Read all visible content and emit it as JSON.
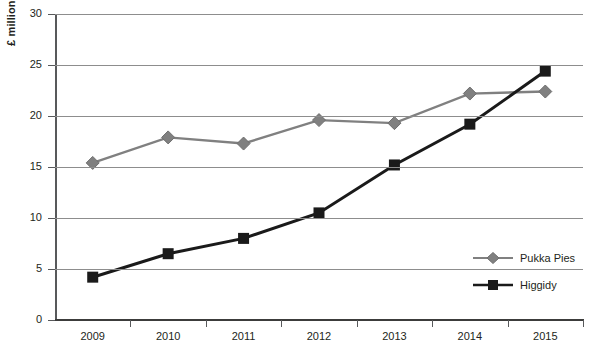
{
  "chart_data": {
    "type": "line",
    "title": "",
    "xlabel": "",
    "ylabel": "£ millions",
    "categories": [
      "2009",
      "2010",
      "2011",
      "2012",
      "2013",
      "2014",
      "2015"
    ],
    "ylim": [
      0,
      30
    ],
    "ytick_step": 5,
    "yticks": [
      "0",
      "5",
      "10",
      "15",
      "20",
      "25",
      "30"
    ],
    "grid": true,
    "legend_position": "right-inside",
    "series": [
      {
        "name": "Pukka Pies",
        "color": "#808080",
        "marker": "diamond",
        "values": [
          15.4,
          17.9,
          17.3,
          19.6,
          19.3,
          22.2,
          22.4
        ]
      },
      {
        "name": "Higgidy",
        "color": "#1a1a1a",
        "marker": "square",
        "values": [
          4.2,
          6.5,
          8.0,
          10.5,
          15.2,
          19.2,
          24.4
        ]
      }
    ]
  },
  "axis": {
    "y_title": "£ millions",
    "axis_color": "#58595b",
    "gridline_color": "#8d8d8d"
  },
  "legend": {
    "entries": [
      {
        "label": "Pukka Pies"
      },
      {
        "label": "Higgidy"
      }
    ]
  }
}
